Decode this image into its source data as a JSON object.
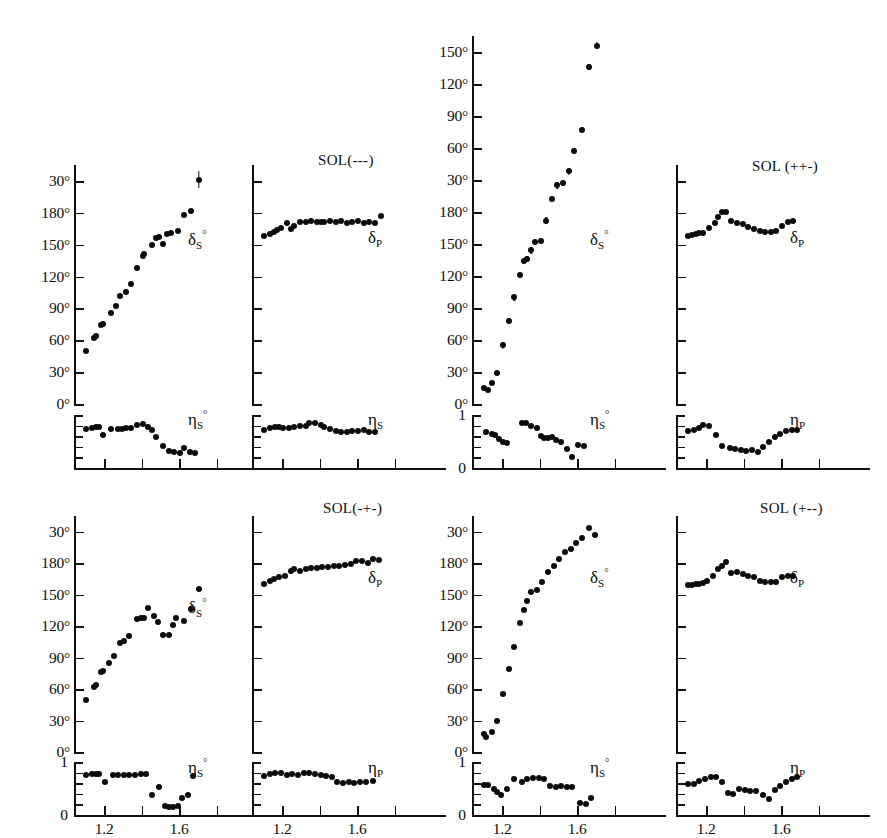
{
  "figure": {
    "type": "multi-panel-scatter",
    "panel_count": 8,
    "rows": 2,
    "columns": 4,
    "point_color": "#0b0b0b",
    "axis_color": "#111111",
    "background": "#ffffff",
    "xlabel_ticks": [
      "1.2",
      "1.6"
    ]
  },
  "chart_data": [
    {
      "id": "p1-delta-s",
      "type": "scatter",
      "solution": "SOL(---)",
      "title": "",
      "ylabel": "δ_S°",
      "curve_label_base": "δ",
      "curve_label_sub": "S",
      "curve_label_deg": "°",
      "xlabel": "",
      "xlim": [
        1.04,
        1.86
      ],
      "ylim": [
        0,
        225
      ],
      "grid": false,
      "yticks": [
        0,
        30,
        60,
        90,
        120,
        150,
        180,
        210
      ],
      "yticklabels": [
        "0°",
        "30°",
        "60°",
        "90°",
        "120°",
        "150°",
        "180°",
        "30°"
      ],
      "xticks": [
        1.0,
        1.2,
        1.4,
        1.6,
        1.8
      ],
      "x": [
        1.105,
        1.145,
        1.155,
        1.185,
        1.195,
        1.235,
        1.265,
        1.285,
        1.315,
        1.345,
        1.375,
        1.405,
        1.415,
        1.455,
        1.475,
        1.495,
        1.515,
        1.535,
        1.555,
        1.595,
        1.625,
        1.665,
        1.705
      ],
      "values": [
        50,
        62,
        64,
        74,
        75,
        86,
        92,
        102,
        105,
        113,
        128,
        139,
        141,
        150,
        156,
        157,
        151,
        160,
        161,
        163,
        178,
        182,
        211
      ],
      "yerr": [
        0,
        0,
        0,
        0,
        0,
        0,
        0,
        0,
        0,
        0,
        0,
        0,
        0,
        0,
        0,
        0,
        0,
        0,
        0,
        0,
        0,
        0,
        8
      ]
    },
    {
      "id": "p1-eta-s",
      "type": "scatter",
      "ylabel": "η_S°",
      "curve_label_base": "η",
      "curve_label_sub": "S",
      "curve_label_deg": "°",
      "ylim": [
        0,
        1
      ],
      "yticks": [
        0,
        0.2,
        0.4,
        0.6,
        0.8,
        1.0
      ],
      "yticklabels": [
        "",
        "",
        "",
        "",
        "",
        ""
      ],
      "x": [
        1.105,
        1.135,
        1.155,
        1.175,
        1.195,
        1.235,
        1.275,
        1.295,
        1.315,
        1.345,
        1.375,
        1.405,
        1.435,
        1.455,
        1.475,
        1.515,
        1.545,
        1.575,
        1.605,
        1.625,
        1.655,
        1.685
      ],
      "values": [
        0.74,
        0.76,
        0.77,
        0.78,
        0.62,
        0.73,
        0.74,
        0.74,
        0.75,
        0.75,
        0.82,
        0.83,
        0.78,
        0.71,
        0.58,
        0.42,
        0.32,
        0.3,
        0.29,
        0.38,
        0.3,
        0.28
      ]
    },
    {
      "id": "p2-delta-p",
      "type": "scatter",
      "solution": "SOL(---)",
      "ylabel": "δ_P",
      "curve_label_base": "δ",
      "curve_label_sub": "P",
      "curve_label_deg": "",
      "ylim": [
        0,
        225
      ],
      "yticks": [
        0,
        30,
        60,
        90,
        120,
        150,
        180,
        210
      ],
      "yticklabels": [
        "",
        "",
        "",
        "",
        "",
        "",
        "",
        ""
      ],
      "x": [
        1.105,
        1.135,
        1.155,
        1.175,
        1.195,
        1.225,
        1.245,
        1.265,
        1.295,
        1.325,
        1.355,
        1.385,
        1.405,
        1.425,
        1.455,
        1.485,
        1.515,
        1.545,
        1.575,
        1.605,
        1.635,
        1.665,
        1.695,
        1.725
      ],
      "values": [
        158,
        160,
        162,
        164,
        166,
        170,
        165,
        168,
        171,
        171,
        172,
        171,
        171,
        171,
        172,
        171,
        172,
        170,
        171,
        172,
        170,
        171,
        170,
        177
      ]
    },
    {
      "id": "p2-eta-s",
      "type": "scatter",
      "ylabel": "η_S",
      "curve_label_base": "η",
      "curve_label_sub": "S",
      "curve_label_deg": "",
      "ylim": [
        0,
        1
      ],
      "x": [
        1.105,
        1.135,
        1.165,
        1.185,
        1.205,
        1.235,
        1.265,
        1.295,
        1.325,
        1.345,
        1.375,
        1.405,
        1.425,
        1.455,
        1.485,
        1.515,
        1.545,
        1.575,
        1.605,
        1.635,
        1.665,
        1.695
      ],
      "values": [
        0.72,
        0.76,
        0.78,
        0.78,
        0.76,
        0.75,
        0.78,
        0.79,
        0.8,
        0.84,
        0.85,
        0.82,
        0.78,
        0.73,
        0.69,
        0.68,
        0.68,
        0.69,
        0.7,
        0.71,
        0.68,
        0.68
      ]
    },
    {
      "id": "p3-delta-s",
      "type": "scatter",
      "solution": "SOL (++-)",
      "ylabel": "δ_S°",
      "curve_label_base": "δ",
      "curve_label_sub": "S",
      "curve_label_deg": "°",
      "ylim": [
        0,
        345
      ],
      "yticks": [
        0,
        30,
        60,
        90,
        120,
        150,
        180,
        210,
        240,
        270,
        300,
        330
      ],
      "yticklabels": [
        "0°",
        "30°",
        "60°",
        "90°",
        "120°",
        "150°",
        "180°",
        "30°",
        "60°",
        "90°",
        "120°",
        "150°"
      ],
      "x": [
        1.105,
        1.125,
        1.145,
        1.175,
        1.205,
        1.235,
        1.265,
        1.295,
        1.315,
        1.335,
        1.355,
        1.375,
        1.405,
        1.435,
        1.465,
        1.495,
        1.525,
        1.555,
        1.585,
        1.625,
        1.665,
        1.705
      ],
      "values": [
        15,
        13,
        20,
        29,
        55,
        78,
        100,
        121,
        134,
        136,
        144,
        152,
        153,
        172,
        192,
        205,
        207,
        218,
        237,
        257,
        316,
        336
      ],
      "yerr": [
        0,
        0,
        0,
        0,
        3,
        3,
        3,
        3,
        3,
        3,
        3,
        3,
        3,
        3,
        3,
        3,
        3,
        3,
        3,
        3,
        3,
        3
      ]
    },
    {
      "id": "p3-eta-s",
      "type": "scatter",
      "ylabel": "η_S°",
      "curve_label_base": "η",
      "curve_label_sub": "S",
      "curve_label_deg": "°",
      "ylim": [
        0,
        1
      ],
      "ytop_label": "1",
      "ybottom_label": "0",
      "x": [
        1.115,
        1.145,
        1.165,
        1.185,
        1.205,
        1.225,
        1.305,
        1.325,
        1.355,
        1.385,
        1.405,
        1.425,
        1.445,
        1.465,
        1.485,
        1.515,
        1.545,
        1.575,
        1.605,
        1.635
      ],
      "values": [
        0.67,
        0.64,
        0.62,
        0.55,
        0.5,
        0.47,
        0.84,
        0.85,
        0.8,
        0.76,
        0.6,
        0.56,
        0.57,
        0.58,
        0.52,
        0.5,
        0.36,
        0.21,
        0.43,
        0.42
      ]
    },
    {
      "id": "p4-delta-p",
      "type": "scatter",
      "solution": "SOL (++-)",
      "ylabel": "δ_P",
      "curve_label_base": "δ",
      "curve_label_sub": "P",
      "curve_label_deg": "",
      "ylim": [
        0,
        225
      ],
      "x": [
        1.105,
        1.125,
        1.145,
        1.165,
        1.185,
        1.215,
        1.245,
        1.265,
        1.285,
        1.305,
        1.335,
        1.365,
        1.395,
        1.425,
        1.455,
        1.485,
        1.515,
        1.545,
        1.575,
        1.605,
        1.635,
        1.665
      ],
      "values": [
        158,
        159,
        160,
        161,
        161,
        166,
        170,
        176,
        181,
        181,
        172,
        170,
        169,
        167,
        165,
        163,
        162,
        162,
        163,
        168,
        171,
        172
      ]
    },
    {
      "id": "p4-eta-p",
      "type": "scatter",
      "ylabel": "η_P",
      "curve_label_base": "η",
      "curve_label_sub": "P",
      "curve_label_deg": "",
      "ylim": [
        0,
        1
      ],
      "x": [
        1.105,
        1.135,
        1.165,
        1.185,
        1.215,
        1.255,
        1.285,
        1.325,
        1.355,
        1.385,
        1.415,
        1.445,
        1.475,
        1.505,
        1.535,
        1.565,
        1.595,
        1.625,
        1.655,
        1.685
      ],
      "values": [
        0.7,
        0.72,
        0.75,
        0.82,
        0.8,
        0.62,
        0.42,
        0.37,
        0.36,
        0.34,
        0.32,
        0.34,
        0.3,
        0.4,
        0.5,
        0.58,
        0.64,
        0.7,
        0.72,
        0.71
      ]
    },
    {
      "id": "p5-delta-s",
      "type": "scatter",
      "solution": "",
      "ylabel": "δ_S°",
      "curve_label_base": "δ",
      "curve_label_sub": "S",
      "curve_label_deg": "°",
      "ylim": [
        0,
        225
      ],
      "yticks": [
        0,
        30,
        60,
        90,
        120,
        150,
        180,
        210
      ],
      "yticklabels": [
        "0°",
        "30°",
        "60°",
        "90°",
        "120°",
        "150°",
        "180°",
        "30°"
      ],
      "x": [
        1.105,
        1.145,
        1.155,
        1.185,
        1.195,
        1.225,
        1.255,
        1.285,
        1.305,
        1.335,
        1.375,
        1.395,
        1.415,
        1.435,
        1.465,
        1.485,
        1.515,
        1.545,
        1.565,
        1.585,
        1.625,
        1.665,
        1.705
      ],
      "values": [
        50,
        62,
        64,
        76,
        77,
        85,
        92,
        104,
        106,
        111,
        127,
        128,
        128,
        137,
        130,
        124,
        112,
        112,
        121,
        128,
        125,
        136,
        155
      ]
    },
    {
      "id": "p5-eta-s",
      "type": "scatter",
      "ylabel": "η_S°",
      "curve_label_base": "η",
      "curve_label_sub": "S",
      "curve_label_deg": "°",
      "ylim": [
        0,
        1
      ],
      "ytop_label": "1",
      "ybottom_label": "0",
      "x": [
        1.105,
        1.135,
        1.155,
        1.175,
        1.205,
        1.245,
        1.275,
        1.305,
        1.335,
        1.365,
        1.395,
        1.425,
        1.455,
        1.495,
        1.525,
        1.545,
        1.565,
        1.595,
        1.615,
        1.645,
        1.675
      ],
      "values": [
        0.75,
        0.77,
        0.78,
        0.78,
        0.62,
        0.76,
        0.76,
        0.75,
        0.76,
        0.76,
        0.77,
        0.77,
        0.38,
        0.52,
        0.17,
        0.16,
        0.16,
        0.17,
        0.32,
        0.38,
        0.74
      ]
    },
    {
      "id": "p6-delta-p",
      "type": "scatter",
      "solution": "SOL(-+-)",
      "ylabel": "δ_P",
      "curve_label_base": "δ",
      "curve_label_sub": "P",
      "curve_label_deg": "",
      "ylim": [
        0,
        225
      ],
      "x": [
        1.105,
        1.135,
        1.155,
        1.185,
        1.215,
        1.245,
        1.265,
        1.295,
        1.325,
        1.355,
        1.385,
        1.415,
        1.445,
        1.475,
        1.505,
        1.535,
        1.565,
        1.595,
        1.625,
        1.655,
        1.685,
        1.715
      ],
      "values": [
        160,
        163,
        165,
        167,
        168,
        173,
        174,
        173,
        174,
        175,
        175,
        176,
        176,
        177,
        177,
        178,
        179,
        182,
        182,
        180,
        184,
        183
      ]
    },
    {
      "id": "p6-eta-p",
      "type": "scatter",
      "ylabel": "η_P",
      "curve_label_base": "η",
      "curve_label_sub": "P",
      "curve_label_deg": "",
      "ylim": [
        0,
        1
      ],
      "x": [
        1.105,
        1.135,
        1.165,
        1.195,
        1.225,
        1.255,
        1.285,
        1.315,
        1.345,
        1.375,
        1.405,
        1.435,
        1.465,
        1.495,
        1.525,
        1.555,
        1.585,
        1.615,
        1.645,
        1.685
      ],
      "values": [
        0.73,
        0.77,
        0.79,
        0.79,
        0.76,
        0.77,
        0.76,
        0.79,
        0.79,
        0.77,
        0.75,
        0.73,
        0.72,
        0.62,
        0.61,
        0.62,
        0.61,
        0.62,
        0.62,
        0.64
      ]
    },
    {
      "id": "p7-delta-s",
      "type": "scatter",
      "solution": "",
      "ylabel": "δ_S°",
      "curve_label_base": "δ",
      "curve_label_sub": "S",
      "curve_label_deg": "°",
      "ylim": [
        0,
        225
      ],
      "yticks": [
        0,
        30,
        60,
        90,
        120,
        150,
        180,
        210
      ],
      "yticklabels": [
        "0°",
        "30°",
        "60°",
        "90°",
        "120°",
        "150°",
        "180°",
        "30°"
      ],
      "x": [
        1.105,
        1.115,
        1.145,
        1.175,
        1.205,
        1.235,
        1.265,
        1.295,
        1.315,
        1.335,
        1.355,
        1.385,
        1.415,
        1.445,
        1.475,
        1.505,
        1.535,
        1.565,
        1.595,
        1.625,
        1.665,
        1.695
      ],
      "values": [
        17,
        14,
        19,
        30,
        55,
        79,
        100,
        123,
        135,
        144,
        153,
        154,
        162,
        172,
        177,
        184,
        191,
        194,
        199,
        204,
        214,
        207
      ]
    },
    {
      "id": "p7-eta-s",
      "type": "scatter",
      "ylabel": "η_S°",
      "curve_label_base": "η",
      "curve_label_sub": "S",
      "curve_label_deg": "°",
      "ylim": [
        0,
        1
      ],
      "ytop_label": "1",
      "ybottom_label": "0",
      "x": [
        1.105,
        1.125,
        1.155,
        1.175,
        1.195,
        1.225,
        1.265,
        1.305,
        1.335,
        1.365,
        1.395,
        1.425,
        1.455,
        1.485,
        1.515,
        1.545,
        1.575,
        1.615,
        1.645,
        1.675
      ],
      "values": [
        0.57,
        0.57,
        0.5,
        0.44,
        0.38,
        0.5,
        0.68,
        0.62,
        0.68,
        0.69,
        0.7,
        0.68,
        0.55,
        0.52,
        0.55,
        0.52,
        0.53,
        0.23,
        0.21,
        0.32
      ]
    },
    {
      "id": "p8-delta-p",
      "type": "scatter",
      "solution": "SOL (+--)",
      "ylabel": "δ_P",
      "curve_label_base": "δ",
      "curve_label_sub": "P",
      "curve_label_deg": "",
      "ylim": [
        0,
        225
      ],
      "x": [
        1.105,
        1.125,
        1.145,
        1.165,
        1.185,
        1.205,
        1.235,
        1.265,
        1.285,
        1.305,
        1.335,
        1.365,
        1.395,
        1.425,
        1.455,
        1.485,
        1.515,
        1.545,
        1.575,
        1.605,
        1.635,
        1.665
      ],
      "values": [
        159,
        159,
        160,
        160,
        161,
        163,
        168,
        174,
        177,
        181,
        171,
        172,
        170,
        168,
        167,
        163,
        162,
        162,
        162,
        167,
        168,
        168
      ]
    },
    {
      "id": "p8-eta-p",
      "type": "scatter",
      "ylabel": "η_P",
      "curve_label_base": "η",
      "curve_label_sub": "P",
      "curve_label_deg": "",
      "ylim": [
        0,
        1
      ],
      "x": [
        1.105,
        1.135,
        1.165,
        1.195,
        1.225,
        1.255,
        1.285,
        1.315,
        1.345,
        1.375,
        1.405,
        1.435,
        1.465,
        1.505,
        1.535,
        1.565,
        1.595,
        1.625,
        1.655,
        1.685
      ],
      "values": [
        0.58,
        0.58,
        0.64,
        0.68,
        0.72,
        0.72,
        0.62,
        0.41,
        0.39,
        0.5,
        0.48,
        0.45,
        0.46,
        0.38,
        0.3,
        0.48,
        0.55,
        0.62,
        0.68,
        0.72
      ]
    }
  ],
  "labels": {
    "sol_1": "SOL(---)",
    "sol_2": "SOL (++-)",
    "sol_3": "SOL(-+-)",
    "sol_4": "SOL (+--)",
    "eta_one": "1",
    "eta_zero": "0",
    "x_1_2": "1.2",
    "x_1_6": "1.6"
  }
}
